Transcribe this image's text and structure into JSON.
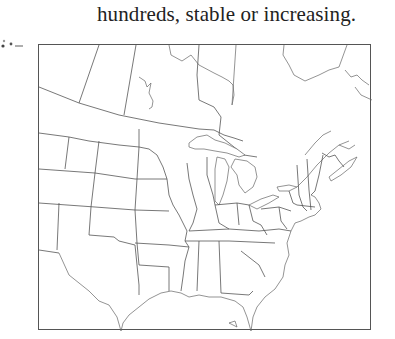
{
  "caption": {
    "text": "hundreds, stable or increasing."
  },
  "map": {
    "region": "Eastern North America",
    "style": "outline map with state and province boundaries",
    "frame_color": "#555555",
    "line_color": "#555555",
    "background": "#ffffff"
  }
}
